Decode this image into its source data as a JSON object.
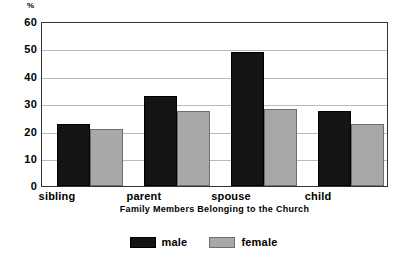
{
  "chart_data": {
    "type": "bar",
    "title": "",
    "categories": [
      "sibling",
      "parent",
      "spouse",
      "child"
    ],
    "series": [
      {
        "name": "male",
        "color": "#141414",
        "values": [
          23,
          33,
          49.5,
          27.5
        ]
      },
      {
        "name": "female",
        "color": "#a8a8a8",
        "values": [
          21,
          27.5,
          28.5,
          23
        ]
      }
    ],
    "xlabel": "Family Members Belonging to the Church",
    "ylabel": "%",
    "ylim": [
      0,
      60
    ],
    "yticks": [
      0,
      10,
      20,
      30,
      40,
      50,
      60
    ],
    "ytick_labels": [
      "0",
      "10",
      "20",
      "30",
      "40",
      "50",
      "60"
    ],
    "grid": true,
    "legend_position": "bottom-center"
  },
  "axes": {
    "y_unit": "%",
    "y_labels": [
      "60",
      "50",
      "40",
      "30",
      "20",
      "10",
      "0"
    ],
    "x_labels": [
      "sibling",
      "parent",
      "spouse",
      "child"
    ],
    "x_title": "Family Members Belonging to the Church"
  },
  "legend": {
    "entries": [
      {
        "label": "male",
        "color": "#141414"
      },
      {
        "label": "female",
        "color": "#a8a8a8"
      }
    ]
  }
}
